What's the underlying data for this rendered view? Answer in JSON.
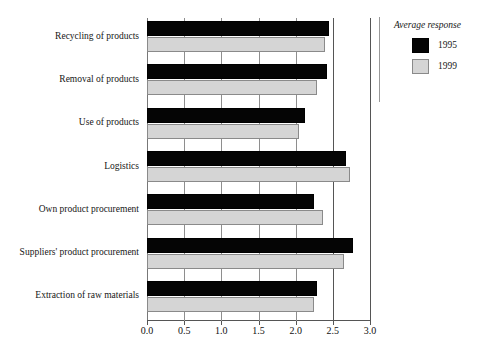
{
  "chart_data": {
    "type": "bar",
    "orientation": "horizontal",
    "title": "",
    "subtitle": "",
    "xlabel": "",
    "ylabel": "",
    "xlim": [
      0.0,
      3.0
    ],
    "xticks": [
      "0.0",
      "0.5",
      "1.0",
      "1.5",
      "2.0",
      "2.5",
      "3.0"
    ],
    "xtick_values": [
      0.0,
      0.5,
      1.0,
      1.5,
      2.0,
      2.5,
      3.0
    ],
    "grid": true,
    "grid_axis": "x",
    "legend_position": "right",
    "categories": [
      "Recycling of products",
      "Removal of products",
      "Use of products",
      "Logistics",
      "Own product procurement",
      "Suppliers' product procurement",
      "Extraction of raw materials"
    ],
    "series": [
      {
        "name": "1995",
        "color": "#050505",
        "values": [
          2.45,
          2.42,
          2.13,
          2.68,
          2.25,
          2.77,
          2.29
        ]
      },
      {
        "name": "1999",
        "color": "#d5d5d5",
        "values": [
          2.4,
          2.29,
          2.05,
          2.73,
          2.37,
          2.65,
          2.24
        ]
      }
    ]
  },
  "legend": {
    "title": "Average response",
    "entries": [
      {
        "label": "1995",
        "color": "#050505"
      },
      {
        "label": "1999",
        "color": "#d5d5d5"
      }
    ]
  },
  "colors": {
    "series_1995": "#050505",
    "series_1999": "#d5d5d5",
    "axis": "#555555",
    "grid": "#8e8e8e",
    "background": "#ffffff"
  }
}
